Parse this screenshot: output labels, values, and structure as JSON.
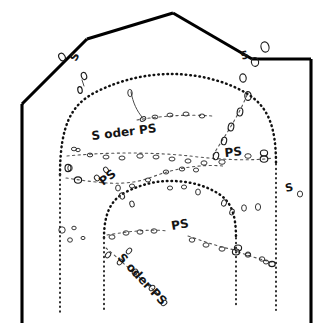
{
  "figure": {
    "background_color": "#ffffff",
    "ink_color": "#000000",
    "width": 331,
    "height": 323
  },
  "legend_keys": {
    "s": "S",
    "ps": "PS",
    "s_oder_ps": "S oder PS"
  },
  "labels": [
    {
      "id": "label-top-left-s",
      "text": "S",
      "x": 76,
      "y": 62,
      "rotation": -62,
      "size": 11
    },
    {
      "id": "label-top-right-s",
      "text": "S",
      "x": 242,
      "y": 60,
      "rotation": -18,
      "size": 11
    },
    {
      "id": "label-upper-s-oder-ps",
      "text": "S oder PS",
      "x": 92,
      "y": 140,
      "rotation": -7,
      "size": 12
    },
    {
      "id": "label-right-ps",
      "text": "PS",
      "x": 225,
      "y": 157,
      "rotation": -6,
      "size": 12
    },
    {
      "id": "label-left-ps",
      "text": "PS",
      "x": 103,
      "y": 186,
      "rotation": -38,
      "size": 12
    },
    {
      "id": "label-right-edge-s",
      "text": "S",
      "x": 286,
      "y": 192,
      "rotation": -12,
      "size": 11
    },
    {
      "id": "label-center-ps",
      "text": "PS",
      "x": 172,
      "y": 230,
      "rotation": -10,
      "size": 12
    },
    {
      "id": "label-lower-s-oder-ps",
      "text": "S oder PS",
      "x": 117,
      "y": 258,
      "rotation": 47,
      "size": 12
    }
  ],
  "outer_wall": {
    "name": "outer-wall-outline",
    "points": "21,105 21,323 21,105 85,39 173,13 253,60 310,60 310,323"
  },
  "structures": {
    "outer_vault_arch": "Outer dotted vault arch spanning left pier to right pier",
    "inner_vault_arch": "Inner dotted vault arch, lower and narrower",
    "left_pier": "Vertical dotted pier line at left",
    "right_pier": "Vertical dotted pier line at right",
    "center_piers": "Two inner vertical dotted pier lines",
    "stone_courses": "Rows of small oval stone outlines along joint lines"
  }
}
